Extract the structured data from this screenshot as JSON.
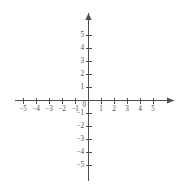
{
  "chart_data": {
    "type": "scatter",
    "title": "",
    "subtitle": "",
    "xlabel": "",
    "ylabel": "",
    "xlim": [
      -5.8,
      6.5
    ],
    "ylim": [
      -6.4,
      6.6
    ],
    "grid": false,
    "legend": null,
    "series": [],
    "x": [],
    "values": [],
    "annotations": [],
    "axes": {
      "x_ticks": [
        -5,
        -4,
        -3,
        -2,
        -1,
        1,
        2,
        3,
        4,
        5
      ],
      "y_ticks": [
        5,
        4,
        3,
        2,
        1,
        -1,
        -2,
        -3,
        -4,
        -5
      ],
      "x_tick_labels": [
        "−5",
        "−4",
        "−3",
        "−2",
        "−1",
        "1",
        "2",
        "3",
        "4",
        "5"
      ],
      "y_tick_labels": [
        "5",
        "4",
        "3",
        "2",
        "1",
        "−1",
        "−2",
        "−3",
        "−4",
        "−5"
      ],
      "origin_label": "0",
      "x_axis_arrow": "right",
      "y_axis_arrow": "up",
      "tick_interval": 1,
      "axis_color": "#4d4d4d",
      "background_color": "#ffffff"
    }
  },
  "geometry": {
    "origin_x_px": 88,
    "origin_y_px": 100,
    "unit_px": 13,
    "x_axis_start_px": 15,
    "x_axis_end_px": 174,
    "y_axis_top_px": 13,
    "y_axis_bottom_px": 181,
    "tick_half_len_px": 3
  }
}
